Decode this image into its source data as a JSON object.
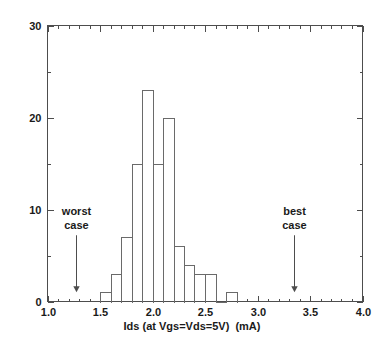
{
  "chart_data": {
    "type": "bar",
    "title": "",
    "subtitle": "",
    "xlabel": "Ids (at Vgs=Vds=5V)  (mA)",
    "ylabel": "",
    "xlim": [
      1.0,
      4.0
    ],
    "ylim": [
      0,
      30
    ],
    "grid": false,
    "legend": "none",
    "bin_width": 0.1,
    "x_ticks": [
      "1.0",
      "1.5",
      "2.0",
      "2.5",
      "3.0",
      "3.5",
      "4.0"
    ],
    "x_tick_values": [
      1.0,
      1.5,
      2.0,
      2.5,
      3.0,
      3.5,
      4.0
    ],
    "x_minor_tick_values": [
      1.1,
      1.2,
      1.3,
      1.4,
      1.6,
      1.7,
      1.8,
      1.9,
      2.1,
      2.2,
      2.3,
      2.4,
      2.6,
      2.7,
      2.8,
      2.9,
      3.1,
      3.2,
      3.3,
      3.4,
      3.6,
      3.7,
      3.8,
      3.9
    ],
    "y_ticks": [
      "0",
      "10",
      "20",
      "30"
    ],
    "y_tick_values": [
      0,
      10,
      20,
      30
    ],
    "y_minor_tick_values": [
      5,
      15,
      25
    ],
    "bins": [
      {
        "left": 1.5,
        "right": 1.6,
        "count": 1
      },
      {
        "left": 1.6,
        "right": 1.7,
        "count": 3
      },
      {
        "left": 1.7,
        "right": 1.8,
        "count": 7
      },
      {
        "left": 1.8,
        "right": 1.9,
        "count": 15
      },
      {
        "left": 1.9,
        "right": 2.0,
        "count": 23
      },
      {
        "left": 2.0,
        "right": 2.1,
        "count": 15
      },
      {
        "left": 2.1,
        "right": 2.2,
        "count": 20
      },
      {
        "left": 2.2,
        "right": 2.3,
        "count": 6
      },
      {
        "left": 2.3,
        "right": 2.4,
        "count": 4
      },
      {
        "left": 2.4,
        "right": 2.5,
        "count": 3
      },
      {
        "left": 2.5,
        "right": 2.6,
        "count": 3
      },
      {
        "left": 2.6,
        "right": 2.7,
        "count": 0
      },
      {
        "left": 2.7,
        "right": 2.8,
        "count": 1
      }
    ],
    "categories": [
      "1.55",
      "1.65",
      "1.75",
      "1.85",
      "1.95",
      "2.05",
      "2.15",
      "2.25",
      "2.35",
      "2.45",
      "2.55",
      "2.65",
      "2.75"
    ],
    "values": [
      1,
      3,
      7,
      15,
      23,
      15,
      20,
      6,
      4,
      3,
      3,
      0,
      1
    ],
    "annotations": [
      {
        "id": "worst-case",
        "label_line1": "worst",
        "label_line2": "case",
        "x": 1.27,
        "arrow_top_y": 7.2,
        "arrow_bottom_y": 1.0
      },
      {
        "id": "best-case",
        "label_line1": "best",
        "label_line2": "case",
        "x": 3.35,
        "arrow_top_y": 7.2,
        "arrow_bottom_y": 1.0
      }
    ],
    "colors": {
      "background": "#ffffff",
      "axis": "#4d4d4d",
      "histogram_stroke": "#6a6a6a",
      "text": "#1a1a1a"
    }
  }
}
